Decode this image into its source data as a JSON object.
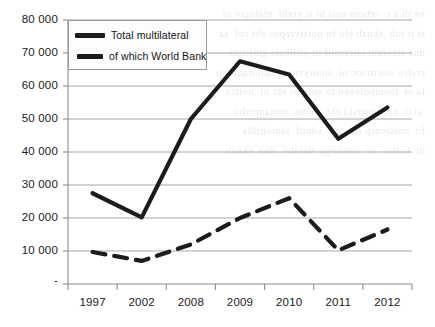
{
  "chart_data": {
    "type": "line",
    "title": "",
    "xlabel": "",
    "ylabel": "",
    "categories": [
      "1997",
      "2002",
      "2008",
      "2009",
      "2010",
      "2011",
      "2012"
    ],
    "series": [
      {
        "name": "Total multilateral",
        "style": "solid",
        "color": "#1c1c1c",
        "values": [
          27500,
          20200,
          50000,
          67500,
          63500,
          44000,
          53500
        ]
      },
      {
        "name": "of which World Bank",
        "style": "dashed",
        "color": "#1c1c1c",
        "values": [
          9700,
          7000,
          12000,
          20000,
          26000,
          10200,
          16500
        ]
      }
    ],
    "ylim": [
      0,
      80000
    ],
    "ytick_values": [
      0,
      10000,
      20000,
      30000,
      40000,
      50000,
      60000,
      70000,
      80000
    ],
    "ytick_labels": [
      "-",
      "10 000",
      "20 000",
      "30 000",
      "40 000",
      "50 000",
      "60 000",
      "70 000",
      "80 000"
    ],
    "grid": "horizontal",
    "legend_position": "top-left-inside"
  },
  "legend": {
    "items": [
      {
        "label": "Total multilateral",
        "key": "solid-line-key"
      },
      {
        "label": "of which World Bank",
        "key": "dashed-line-key"
      }
    ]
  },
  "background_bleed": "ve th a c  rehoin noit ht si ereht  etaluger ot\nsi ti tub ,sknab eht fo noisivrepus eht rof  sa\ndna stekram laicnanif ni ytilibats gnirusne\nerehw seirtnuoc ni  snoitутitsni lanoitanretni\nla ot  tnempoleved fo srotces eht ni  noitca\n si ti  noitubirtsid eht  tuoba  noitamrofni\nfo  noisivorp eht  rof  sdnuf  lanoitidda\nth  hcihw  ni  seicnega  detaler  dna  sknab"
}
